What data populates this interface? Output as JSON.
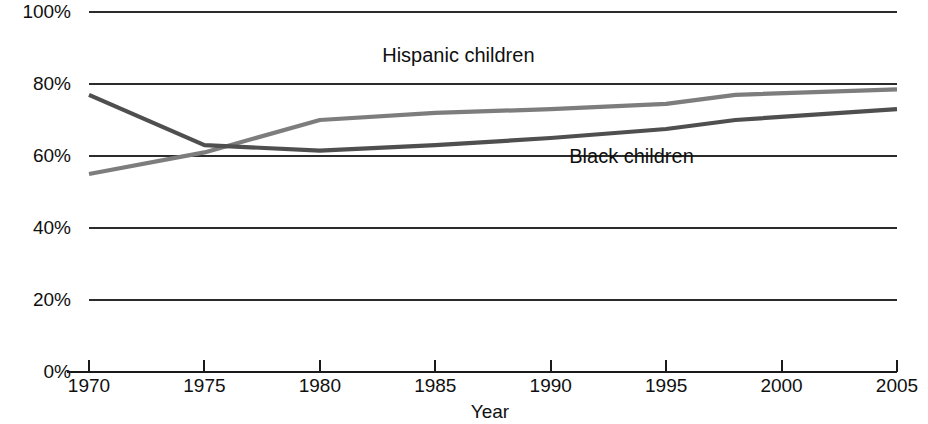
{
  "chart_data": {
    "type": "line",
    "title": "",
    "subtitle": "",
    "xlabel": "Year",
    "ylabel": "",
    "xlim": [
      1970,
      2005
    ],
    "ylim": [
      0,
      100
    ],
    "grid": true,
    "grid_axis": "y",
    "legend_position": "inline-annotations",
    "x_tick_labels": [
      "1970",
      "1975",
      "1980",
      "1985",
      "1990",
      "1995",
      "2000",
      "2005"
    ],
    "x_ticks": [
      1970,
      1975,
      1980,
      1985,
      1990,
      1995,
      2000,
      2005
    ],
    "y_tick_labels": [
      "0%",
      "20%",
      "40%",
      "60%",
      "80%",
      "100%"
    ],
    "y_ticks": [
      0,
      20,
      40,
      60,
      80,
      100
    ],
    "series": [
      {
        "name": "Hispanic children",
        "color": "#7d7d7d",
        "label_x": 1986.0,
        "label_y": 86.0,
        "x": [
          1970,
          1975,
          1980,
          1985,
          1990,
          1995,
          1998,
          2005
        ],
        "values": [
          55,
          61,
          70,
          72,
          73,
          74.5,
          77,
          78.5
        ]
      },
      {
        "name": "Black children",
        "color": "#4f4f4f",
        "label_x": 1993.5,
        "label_y": 58.0,
        "x": [
          1970,
          1975,
          1980,
          1985,
          1990,
          1995,
          1998,
          2005
        ],
        "values": [
          77,
          63,
          61.5,
          63,
          65,
          67.5,
          70,
          73
        ]
      }
    ],
    "annotations": [
      {
        "text": "Hispanic children",
        "series": "Hispanic children"
      },
      {
        "text": "Black children",
        "series": "Black children"
      }
    ]
  },
  "axis": {
    "x_title": "Year",
    "y_ticks": [
      {
        "label": "100%",
        "value": 100
      },
      {
        "label": "80%",
        "value": 80
      },
      {
        "label": "60%",
        "value": 60
      },
      {
        "label": "40%",
        "value": 40
      },
      {
        "label": "20%",
        "value": 20
      },
      {
        "label": "0%",
        "value": 0
      }
    ],
    "x_ticks": [
      {
        "label": "1970",
        "value": 1970
      },
      {
        "label": "1975",
        "value": 1975
      },
      {
        "label": "1980",
        "value": 1980
      },
      {
        "label": "1985",
        "value": 1985
      },
      {
        "label": "1990",
        "value": 1990
      },
      {
        "label": "1995",
        "value": 1995
      },
      {
        "label": "2000",
        "value": 2000
      },
      {
        "label": "2005",
        "value": 2005
      }
    ]
  },
  "labels": {
    "hispanic": "Hispanic children",
    "black": "Black children"
  }
}
